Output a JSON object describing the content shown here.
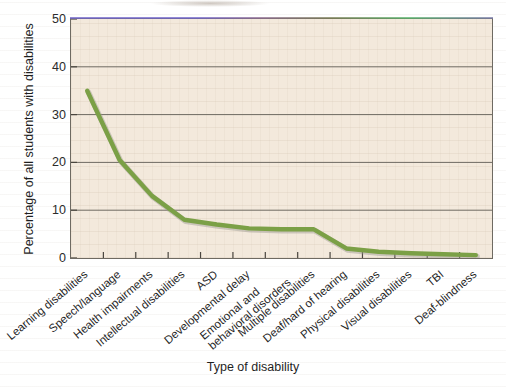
{
  "figure": {
    "background_color": "#ffffff",
    "plot_background_color": "#f3e9dc",
    "line_color": "#7ba046",
    "gridline_color": "#6e6a62",
    "axis_color": "#6e6a62"
  },
  "chart_data": {
    "type": "line",
    "title": "",
    "xlabel": "Type of disability",
    "ylabel": "Percentage of all students with disabilities",
    "ylim": [
      0,
      50
    ],
    "yticks": [
      0,
      10,
      20,
      30,
      40,
      50
    ],
    "grid": true,
    "legend": "none",
    "categories": [
      "Learning disabilities",
      "Speech/language",
      "Health impairments",
      "Intellectual disabilities",
      "ASD",
      "Developmental delay",
      "Emotional and behavioral disorders",
      "Multiple disabilities",
      "Deaf/hard of hearing",
      "Physical disabilities",
      "Visual disabilities",
      "TBI",
      "Deaf-blindness"
    ],
    "category_lines": [
      [
        "Learning disabilities"
      ],
      [
        "Speech/language"
      ],
      [
        "Health impairments"
      ],
      [
        "Intellectual disabilities"
      ],
      [
        "ASD"
      ],
      [
        "Developmental delay"
      ],
      [
        "Emotional and",
        "behavioral disorders"
      ],
      [
        "Multiple disabilities"
      ],
      [
        "Deaf/hard of hearing"
      ],
      [
        "Physical disabilities"
      ],
      [
        "Visual disabilities"
      ],
      [
        "TBI"
      ],
      [
        "Deaf-blindness"
      ]
    ],
    "values": [
      35,
      20.5,
      13,
      8,
      7,
      6.2,
      6,
      6,
      2,
      1.3,
      1,
      0.8,
      0.6
    ]
  }
}
